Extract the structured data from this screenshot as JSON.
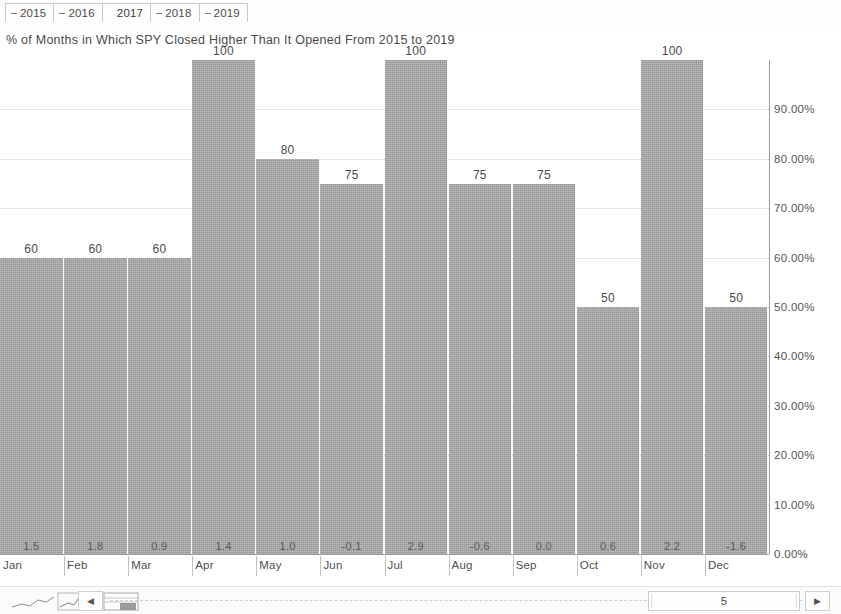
{
  "tabs": [
    {
      "label": "2015",
      "has_dash": true,
      "selected": false
    },
    {
      "label": "2016",
      "has_dash": true,
      "selected": false
    },
    {
      "label": "2017",
      "has_dash": false,
      "selected": true
    },
    {
      "label": "2018",
      "has_dash": true,
      "selected": false
    },
    {
      "label": "2019",
      "has_dash": true,
      "selected": false
    }
  ],
  "chart_title": "% of Months in Which SPY Closed Higher Than It Opened From 2015 to 2019",
  "chart_data": {
    "type": "bar",
    "title": "% of Months in Which SPY Closed Higher Than It Opened From 2015 to 2019",
    "xlabel": "",
    "ylabel": "",
    "ylim": [
      0,
      100
    ],
    "grid": true,
    "legend": "none",
    "categories": [
      "Jan",
      "Feb",
      "Mar",
      "Apr",
      "May",
      "Jun",
      "Jul",
      "Aug",
      "Sep",
      "Oct",
      "Nov",
      "Dec"
    ],
    "values": [
      60,
      60,
      60,
      100,
      80,
      75,
      100,
      75,
      75,
      50,
      100,
      50
    ],
    "inner_values": [
      "1.5",
      "1.8",
      "0.9",
      "1.4",
      "1.0",
      "-0.1",
      "2.9",
      "-0.6",
      "0.0",
      "0.6",
      "2.2",
      "-1.6"
    ],
    "y_ticks": [
      "90.00%",
      "80.00%",
      "70.00%",
      "60.00%",
      "50.00%",
      "40.00%",
      "30.00%",
      "20.00%",
      "10.00%",
      "0.00%"
    ],
    "y_tick_values": [
      90,
      80,
      70,
      60,
      50,
      40,
      30,
      20,
      10,
      0
    ],
    "bar_color": "#a9a9a9",
    "gridline_color": "#d9c9c9",
    "axis_color": "#9a9a9a"
  },
  "bottom_bar": {
    "scroll_left_glyph": "◀",
    "scroll_right_glyph": "▶",
    "scroll_thumb_label": "5"
  }
}
